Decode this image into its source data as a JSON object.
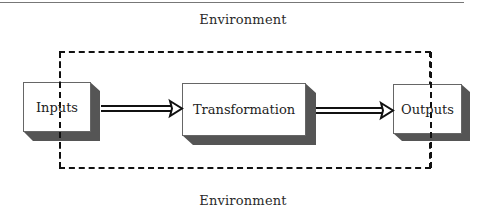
{
  "diagram": {
    "type": "process-flow",
    "environment_top_label": "Environment",
    "environment_bottom_label": "Environment",
    "boundary": {
      "style": "dashed",
      "color": "#111111"
    },
    "nodes": [
      {
        "id": "inputs",
        "label": "Inputs"
      },
      {
        "id": "transformation",
        "label": "Transformation"
      },
      {
        "id": "outputs",
        "label": "Outputs"
      }
    ],
    "edges": [
      {
        "from": "inputs",
        "to": "transformation",
        "style": "double-line-arrow"
      },
      {
        "from": "transformation",
        "to": "outputs",
        "style": "double-line-arrow"
      }
    ],
    "colors": {
      "box_fill": "#ffffff",
      "box_shadow": "#555555",
      "line": "#111111",
      "text": "#222222"
    }
  }
}
